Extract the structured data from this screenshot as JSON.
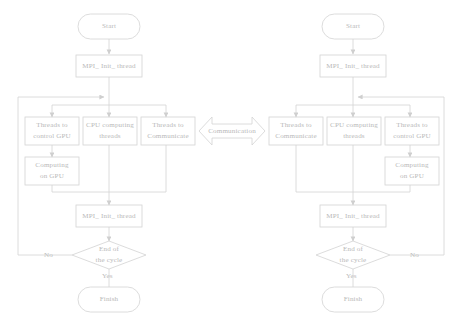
{
  "diagram": {
    "stroke_color": "#d3d3d3",
    "text_color": "#bcbcbc",
    "background_color": "#ffffff",
    "left_branch": {
      "start": "Start",
      "mpi_init_top": "MPI_ Init_ thread",
      "parallel_tasks": [
        "Threads to\ncontrol GPU",
        "CPU computing\nthreads",
        "Threads to\nCommunicate"
      ],
      "gpu_compute": "Computing\non GPU",
      "mpi_init_bottom": "MPI_ Init_ thread",
      "decision": "End of\nthe cycle",
      "decision_no": "No",
      "decision_yes": "Yes",
      "finish": "Finish"
    },
    "right_branch": {
      "start": "Start",
      "mpi_init_top": "MPI_ Init_ thread",
      "parallel_tasks": [
        "Threads to\nCommunicate",
        "CPU computing\nthreads",
        "Threads to\ncontrol GPU"
      ],
      "gpu_compute": "Computing\non GPU",
      "mpi_init_bottom": "MPI_ Init_ thread",
      "decision": "End of\nthe cycle",
      "decision_no": "No",
      "decision_yes": "Yes",
      "finish": "Finish"
    },
    "center": {
      "communication_label": "Communication"
    }
  }
}
